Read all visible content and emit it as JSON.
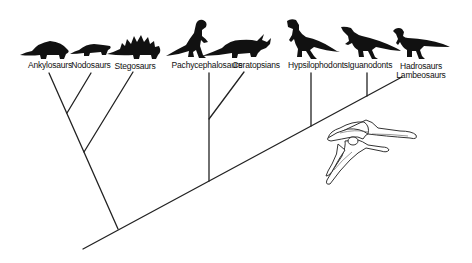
{
  "figure": {
    "type": "cladogram",
    "taxa": [
      {
        "label": "Ankylosaurs",
        "x": 50
      },
      {
        "label": "Nodosaurs",
        "x": 91
      },
      {
        "label": "Stegosaurs",
        "x": 135
      },
      {
        "label": "Pachycephalosaurs",
        "x": 207
      },
      {
        "label": "Ceratopsians",
        "x": 256
      },
      {
        "label": "Hypsilophodonts",
        "x": 318
      },
      {
        "label": "Iguanodonts",
        "x": 370
      },
      {
        "label": "Hadrosaurs",
        "x": 421
      },
      {
        "label": "Lambeosaurs",
        "x": 421
      }
    ],
    "annotation": "pelvis-illustration",
    "colors": {
      "line": "#222222",
      "silhouette": "#111111",
      "background": "#ffffff"
    }
  }
}
